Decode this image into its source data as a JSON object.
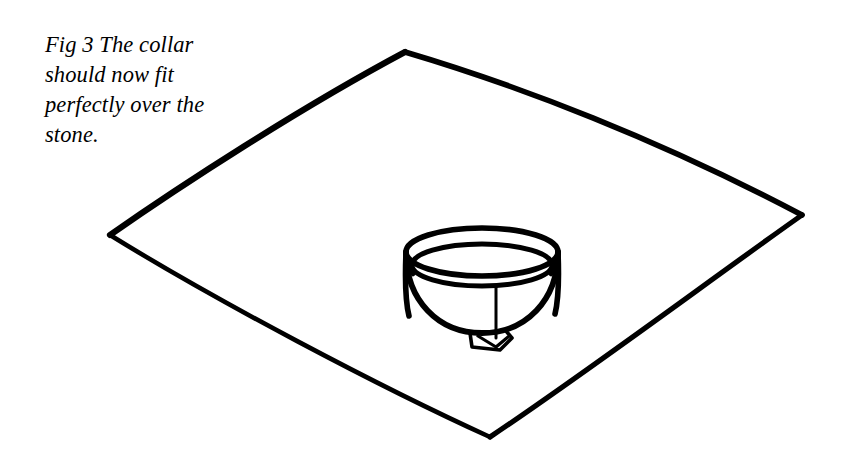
{
  "figure": {
    "caption": "Fig 3 The collar\nshould now fit\nperfectly over the\nstone.",
    "caption_lines": [
      "Fig 3 The collar",
      "should now fit",
      "perfectly over the",
      "stone."
    ],
    "figure_number": "Fig 3",
    "background_color": "#ffffff",
    "ink_color": "#000000",
    "objects": [
      {
        "name": "stone-sheet",
        "description": "large hand-drawn diamond-shaped sheet seen in perspective",
        "corners": {
          "top": [
            405,
            52
          ],
          "left": [
            110,
            235
          ],
          "bottom": [
            490,
            437
          ],
          "right": [
            802,
            215
          ]
        }
      },
      {
        "name": "collar",
        "description": "open cylindrical collar resting on the sheet",
        "center": [
          482,
          252
        ],
        "outer_radius_x": 76,
        "outer_radius_y": 24,
        "height": 72,
        "rim_thickness": 13,
        "seam_x": 496,
        "has_tab": true
      }
    ]
  }
}
